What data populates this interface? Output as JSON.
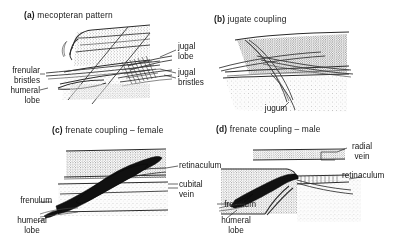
{
  "figure": {
    "background_color": "#ffffff",
    "ink_color": "#1a1a1a"
  },
  "panels": [
    {
      "tag": "(a)",
      "title": "mecopteran pattern",
      "labels": [
        {
          "text": "frenular",
          "position": "left"
        },
        {
          "text": "bristles",
          "position": "left"
        },
        {
          "text": "humeral",
          "position": "left"
        },
        {
          "text": "lobe",
          "position": "left"
        },
        {
          "text": "jugal",
          "position": "right"
        },
        {
          "text": "lobe",
          "position": "right"
        },
        {
          "text": "jugal",
          "position": "right"
        },
        {
          "text": "bristles",
          "position": "right"
        }
      ]
    },
    {
      "tag": "(b)",
      "title": "jugate coupling",
      "labels": [
        {
          "text": "jugum",
          "position": "bottom"
        }
      ]
    },
    {
      "tag": "(c)",
      "title": "frenate coupling – female",
      "labels": [
        {
          "text": "frenulum",
          "position": "left"
        },
        {
          "text": "humeral",
          "position": "left"
        },
        {
          "text": "lobe",
          "position": "left"
        },
        {
          "text": "retinaculum",
          "position": "right"
        },
        {
          "text": "cubital",
          "position": "right"
        },
        {
          "text": "vein",
          "position": "right"
        }
      ]
    },
    {
      "tag": "(d)",
      "title": "frenate coupling – male",
      "labels": [
        {
          "text": "frenulum",
          "position": "left"
        },
        {
          "text": "humeral",
          "position": "left"
        },
        {
          "text": "lobe",
          "position": "left"
        },
        {
          "text": "radial",
          "position": "right"
        },
        {
          "text": "vein",
          "position": "right"
        },
        {
          "text": "retinaculum",
          "position": "right"
        }
      ]
    }
  ]
}
